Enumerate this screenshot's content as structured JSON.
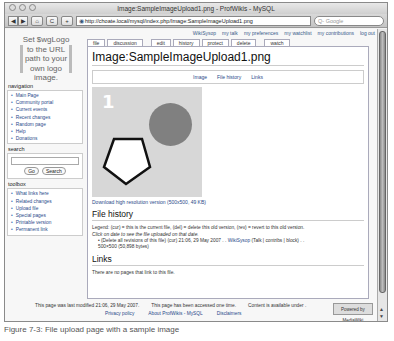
{
  "window": {
    "title": "Image:SampleImageUpload1.png - ProfWikis - MySQL",
    "toolbar": {
      "back": "◀",
      "forward": "▶",
      "home": "⌂",
      "reload": "C",
      "add": "+",
      "url": "http://choate.local/mysql/index.php/Image:SampleImageUpload1.png",
      "search_placeholder": "Q- Google"
    }
  },
  "personal": [
    "WikiSysop",
    "my talk",
    "my preferences",
    "my watchlist",
    "my contributions",
    "log out"
  ],
  "logo": [
    "Set $wgLogo",
    "to the URL",
    "path to your",
    "own logo",
    "image."
  ],
  "tabs": [
    "file",
    "discussion",
    "edit",
    "history",
    "protect",
    "delete",
    "watch"
  ],
  "page": {
    "title": "Image:SampleImageUpload1.png",
    "toc": [
      "Image",
      "File history",
      "Links"
    ],
    "image_number": "1",
    "download": "Download high resolution version (500x500, 49 KB)",
    "file_history_heading": "File history",
    "legend": "Legend: (cur) = this is the current file, (del) = delete this old version, (rev) = revert to this old version.",
    "click_hint": "Click on date to see the file uploaded on that date.",
    "history_entry": "(Delete all revisions of this file) (cur) 21:06, 29 May 2007 . .",
    "history_user": "WikiSysop",
    "history_user_links": "(Talk | contribs | block) . .",
    "history_size": "500×500 (50,898 bytes)",
    "links_heading": "Links",
    "links_text": "There are no pages that link to this file."
  },
  "sidebar": {
    "navigation_heading": "navigation",
    "navigation": [
      "Main Page",
      "Community portal",
      "Current events",
      "Recent changes",
      "Random page",
      "Help",
      "Donations"
    ],
    "search_heading": "search",
    "go": "Go",
    "search": "Search",
    "toolbox_heading": "toolbox",
    "toolbox": [
      "What links here",
      "Related changes",
      "Upload file",
      "Special pages",
      "Printable version",
      "Permanent link"
    ]
  },
  "footer": {
    "modified": "This page was last modified 21:06, 29 May 2007.",
    "accessed": "This page has been accessed one time.",
    "content": "Content is available under .",
    "privacy": "Privacy policy",
    "about": "About ProfWikis - MySQL",
    "disclaimers": "Disclaimers",
    "badge": "Powered by MediaWiki"
  },
  "caption": "Figure 7-3: File upload page with a sample image"
}
